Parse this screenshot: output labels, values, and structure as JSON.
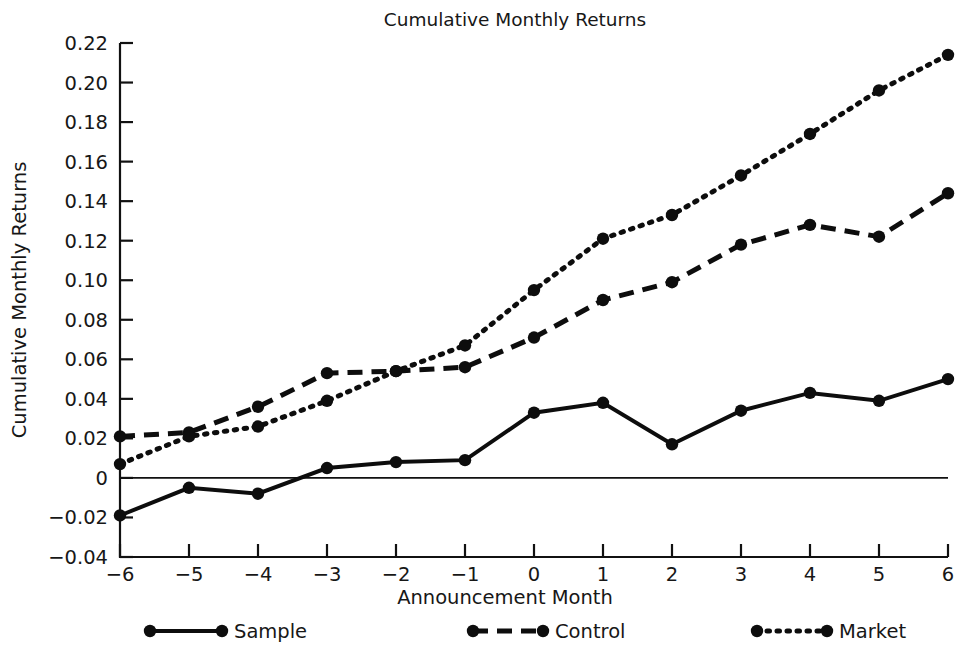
{
  "chart_data": {
    "type": "line",
    "title": "Cumulative Monthly Returns",
    "xlabel": "Announcement Month",
    "ylabel": "Cumulative Monthly Returns",
    "x": [
      -6,
      -5,
      -4,
      -3,
      -2,
      -1,
      0,
      1,
      2,
      3,
      4,
      5,
      6
    ],
    "xtick_labels": [
      "−6",
      "−5",
      "−4",
      "−3",
      "−2",
      "−1",
      "0",
      "1",
      "2",
      "3",
      "4",
      "5",
      "6"
    ],
    "ytick_labels": [
      "−0.04",
      "−0.02",
      "0",
      "0.02",
      "0.04",
      "0.06",
      "0.08",
      "0.10",
      "0.12",
      "0.14",
      "0.16",
      "0.18",
      "0.20",
      "0.22"
    ],
    "ytick_values": [
      -0.04,
      -0.02,
      0,
      0.02,
      0.04,
      0.06,
      0.08,
      0.1,
      0.12,
      0.14,
      0.16,
      0.18,
      0.2,
      0.22
    ],
    "xlim": [
      -6,
      6
    ],
    "ylim": [
      -0.04,
      0.22
    ],
    "grid": false,
    "zero_reference_line": true,
    "legend_position": "bottom",
    "series": [
      {
        "name": "Sample",
        "style": "solid",
        "color": "#0d0d0d",
        "values": [
          -0.019,
          -0.005,
          -0.008,
          0.005,
          0.008,
          0.009,
          0.033,
          0.038,
          0.017,
          0.034,
          0.043,
          0.039,
          0.05
        ]
      },
      {
        "name": "Control",
        "style": "dashed",
        "color": "#0d0d0d",
        "values": [
          0.021,
          0.023,
          0.036,
          0.053,
          0.054,
          0.056,
          0.071,
          0.09,
          0.099,
          0.118,
          0.128,
          0.122,
          0.144
        ]
      },
      {
        "name": "Market",
        "style": "dotted",
        "color": "#0d0d0d",
        "values": [
          0.007,
          0.021,
          0.026,
          0.039,
          0.054,
          0.067,
          0.095,
          0.121,
          0.133,
          0.153,
          0.174,
          0.196,
          0.214
        ]
      }
    ]
  },
  "legend": {
    "items": [
      {
        "label": "Sample",
        "style": "solid"
      },
      {
        "label": "Control",
        "style": "dashed"
      },
      {
        "label": "Market",
        "style": "dotted"
      }
    ]
  }
}
